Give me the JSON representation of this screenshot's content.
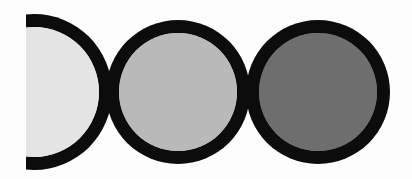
{
  "diagram": {
    "background": "#fdfdfd",
    "ring_color": "#0c0c0c",
    "clip_left_x": 26,
    "circles": [
      {
        "id": "light",
        "cx": 34,
        "cy": 92,
        "r": 78,
        "fill": "#e4e4e4",
        "clipped": true
      },
      {
        "id": "medium",
        "cx": 178,
        "cy": 92,
        "r": 72,
        "fill": "#b9b9b9",
        "clipped": false
      },
      {
        "id": "dark",
        "cx": 318,
        "cy": 92,
        "r": 72,
        "fill": "#6e6e6e",
        "clipped": false
      }
    ],
    "ring_width": 13
  }
}
